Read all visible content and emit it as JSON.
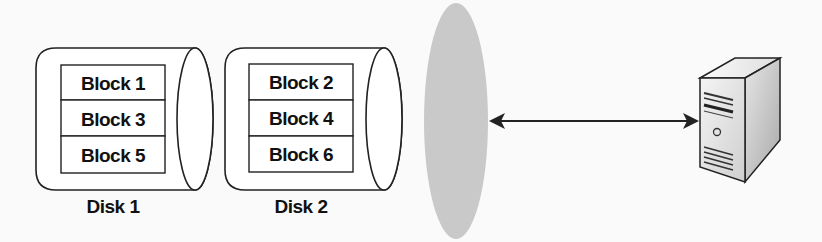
{
  "diagram": {
    "type": "storage-striping",
    "disks": [
      {
        "label": "Disk 1",
        "blocks": [
          "Block 1",
          "Block 3",
          "Block 5"
        ]
      },
      {
        "label": "Disk 2",
        "blocks": [
          "Block 2",
          "Block 4",
          "Block 6"
        ]
      }
    ],
    "volume": {
      "shape": "gray-ellipse",
      "color": "#c8c8c8"
    },
    "connector": {
      "type": "bidirectional-arrow",
      "color": "#222222"
    },
    "host": {
      "icon": "server-tower-icon"
    }
  }
}
